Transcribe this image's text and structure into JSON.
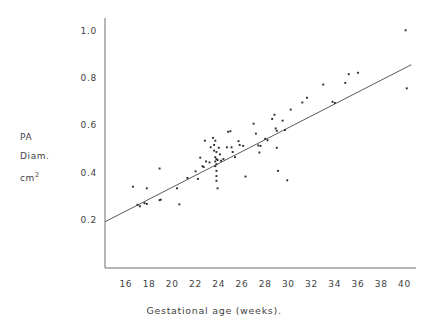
{
  "chart_data": {
    "type": "scatter",
    "title": "",
    "xlabel": "Gestational age (weeks).",
    "ylabel_lines": [
      "PA",
      "Diam.",
      "cm"
    ],
    "ylabel_superscript": "2",
    "xlim": [
      14.2,
      41.0
    ],
    "ylim": [
      0.0,
      1.06
    ],
    "xticks": [
      16,
      18,
      20,
      22,
      24,
      26,
      28,
      30,
      32,
      34,
      36,
      38,
      40
    ],
    "yticks": [
      0.2,
      0.4,
      0.6,
      0.8,
      1.0
    ],
    "ytick_labels": [
      "0.2",
      "0.4",
      "0.6",
      "0.8",
      "1.0"
    ],
    "xtick_labels": [
      "16",
      "18",
      "20",
      "22",
      "24",
      "26",
      "28",
      "30",
      "32",
      "34",
      "36",
      "38",
      "40"
    ],
    "grid": false,
    "legend": false,
    "axis_color": "#6e6e6e",
    "point_color": "#2b2b2b",
    "line_color": "#5a5a5a",
    "fit_line": {
      "label": "regression line",
      "x1": 14.2,
      "y1": 0.196,
      "x2": 40.6,
      "y2": 0.862
    },
    "series": [
      {
        "name": "PA diameter observations",
        "points": [
          [
            17.0,
            0.268
          ],
          [
            17.2,
            0.262
          ],
          [
            17.6,
            0.275
          ],
          [
            17.8,
            0.272
          ],
          [
            16.6,
            0.345
          ],
          [
            17.8,
            0.338
          ],
          [
            18.9,
            0.422
          ],
          [
            18.9,
            0.288
          ],
          [
            19.0,
            0.29
          ],
          [
            20.4,
            0.338
          ],
          [
            20.6,
            0.27
          ],
          [
            21.3,
            0.382
          ],
          [
            22.0,
            0.41
          ],
          [
            22.2,
            0.378
          ],
          [
            22.4,
            0.468
          ],
          [
            22.6,
            0.432
          ],
          [
            22.7,
            0.428
          ],
          [
            22.8,
            0.54
          ],
          [
            22.9,
            0.452
          ],
          [
            23.2,
            0.448
          ],
          [
            23.3,
            0.512
          ],
          [
            23.5,
            0.552
          ],
          [
            23.6,
            0.522
          ],
          [
            23.6,
            0.498
          ],
          [
            23.7,
            0.54
          ],
          [
            23.7,
            0.47
          ],
          [
            23.7,
            0.452
          ],
          [
            23.7,
            0.432
          ],
          [
            23.8,
            0.492
          ],
          [
            23.8,
            0.462
          ],
          [
            23.8,
            0.44
          ],
          [
            23.8,
            0.412
          ],
          [
            23.8,
            0.39
          ],
          [
            23.8,
            0.37
          ],
          [
            23.9,
            0.458
          ],
          [
            23.9,
            0.338
          ],
          [
            24.0,
            0.51
          ],
          [
            24.1,
            0.482
          ],
          [
            24.2,
            0.455
          ],
          [
            24.4,
            0.462
          ],
          [
            24.7,
            0.512
          ],
          [
            24.8,
            0.578
          ],
          [
            25.0,
            0.58
          ],
          [
            25.1,
            0.512
          ],
          [
            25.2,
            0.492
          ],
          [
            25.4,
            0.47
          ],
          [
            25.7,
            0.538
          ],
          [
            25.8,
            0.522
          ],
          [
            26.1,
            0.518
          ],
          [
            26.3,
            0.388
          ],
          [
            27.0,
            0.612
          ],
          [
            27.2,
            0.57
          ],
          [
            27.4,
            0.52
          ],
          [
            27.5,
            0.49
          ],
          [
            27.6,
            0.518
          ],
          [
            28.0,
            0.548
          ],
          [
            28.2,
            0.542
          ],
          [
            28.6,
            0.632
          ],
          [
            28.8,
            0.65
          ],
          [
            28.9,
            0.592
          ],
          [
            29.0,
            0.582
          ],
          [
            29.0,
            0.51
          ],
          [
            29.1,
            0.412
          ],
          [
            29.5,
            0.625
          ],
          [
            29.7,
            0.585
          ],
          [
            29.9,
            0.372
          ],
          [
            30.2,
            0.672
          ],
          [
            31.2,
            0.702
          ],
          [
            31.6,
            0.722
          ],
          [
            33.0,
            0.778
          ],
          [
            33.8,
            0.705
          ],
          [
            34.0,
            0.7
          ],
          [
            34.9,
            0.785
          ],
          [
            35.2,
            0.822
          ],
          [
            36.0,
            0.828
          ],
          [
            40.1,
            1.008
          ],
          [
            40.2,
            0.762
          ]
        ]
      }
    ]
  }
}
